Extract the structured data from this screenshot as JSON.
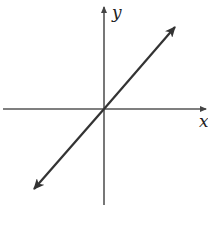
{
  "diagram": {
    "type": "coordinate-plane-line",
    "axes": {
      "x_label": "x",
      "y_label": "y"
    },
    "line": {
      "passes_through": "origin",
      "slope": "positive",
      "both_ends_arrowed": true
    },
    "colors": {
      "axis": "#555555",
      "line": "#333333",
      "background": "#ffffff"
    }
  }
}
